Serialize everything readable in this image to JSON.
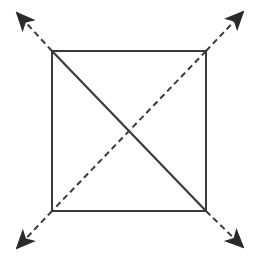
{
  "diagram": {
    "colors": {
      "stroke": "#3a3a3a",
      "arrow_fill": "#2a2a2a",
      "background": "#ffffff"
    },
    "square": {
      "x1": 52,
      "y1": 51,
      "x2": 206,
      "y2": 211
    },
    "solid_diagonal": {
      "from": [
        52,
        51
      ],
      "to": [
        206,
        211
      ]
    },
    "dashed_diagonal": {
      "from": [
        206,
        51
      ],
      "to": [
        52,
        211
      ]
    },
    "arrows": [
      {
        "name": "arrow-top-left",
        "from": [
          52,
          51
        ],
        "to": [
          17,
          13
        ]
      },
      {
        "name": "arrow-top-right",
        "from": [
          206,
          51
        ],
        "to": [
          243,
          12
        ]
      },
      {
        "name": "arrow-bottom-left",
        "from": [
          52,
          211
        ],
        "to": [
          17,
          248
        ]
      },
      {
        "name": "arrow-bottom-right",
        "from": [
          206,
          211
        ],
        "to": [
          243,
          247
        ]
      }
    ]
  }
}
